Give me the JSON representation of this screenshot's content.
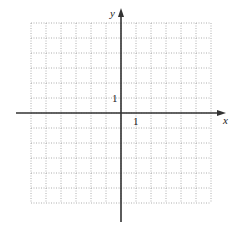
{
  "diagram": {
    "type": "coordinate-grid",
    "grid": {
      "columns": 12,
      "rows": 12,
      "cell_px": 15,
      "left": 31,
      "top": 23,
      "line_style": "dotted",
      "line_color": "#9a9a9a"
    },
    "axes": {
      "origin_px": [
        121,
        113
      ],
      "x_label": "x",
      "y_label": "y",
      "x_unit_label": "1",
      "y_unit_label": "1",
      "axis_color": "#333333",
      "x_range_px": [
        16,
        226
      ],
      "y_range_px": [
        8,
        222
      ]
    }
  }
}
